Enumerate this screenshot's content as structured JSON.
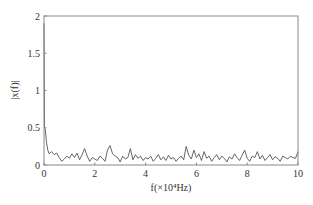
{
  "chart_data": {
    "type": "line",
    "title": "",
    "xlabel": "f(×10⁴Hz)",
    "ylabel": "|x(f)|",
    "xlim": [
      0,
      10
    ],
    "ylim": [
      0,
      2
    ],
    "xticks": [
      0,
      2,
      4,
      6,
      8,
      10
    ],
    "yticks": [
      0,
      0.5,
      1,
      1.5,
      2
    ],
    "xtick_labels": [
      "0",
      "2",
      "4",
      "6",
      "8",
      "10"
    ],
    "ytick_labels": [
      "0",
      "0.5",
      "1",
      "1.5",
      "2"
    ],
    "grid": false,
    "legend": null,
    "series": [
      {
        "name": "spectrum",
        "color": "#555555",
        "x": [
          0,
          0.02,
          0.05,
          0.1,
          0.15,
          0.2,
          0.3,
          0.4,
          0.5,
          0.6,
          0.7,
          0.8,
          0.9,
          1.0,
          1.1,
          1.2,
          1.3,
          1.4,
          1.5,
          1.6,
          1.7,
          1.8,
          1.9,
          2.0,
          2.1,
          2.2,
          2.3,
          2.4,
          2.5,
          2.6,
          2.7,
          2.8,
          2.9,
          3.0,
          3.1,
          3.2,
          3.3,
          3.4,
          3.5,
          3.6,
          3.7,
          3.8,
          3.9,
          4.0,
          4.1,
          4.2,
          4.3,
          4.4,
          4.5,
          4.6,
          4.7,
          4.8,
          4.9,
          5.0,
          5.1,
          5.2,
          5.3,
          5.4,
          5.5,
          5.6,
          5.7,
          5.8,
          5.9,
          6.0,
          6.1,
          6.2,
          6.3,
          6.4,
          6.5,
          6.6,
          6.7,
          6.8,
          6.9,
          7.0,
          7.1,
          7.2,
          7.3,
          7.4,
          7.5,
          7.6,
          7.7,
          7.8,
          7.9,
          8.0,
          8.1,
          8.2,
          8.3,
          8.4,
          8.5,
          8.6,
          8.7,
          8.8,
          8.9,
          9.0,
          9.1,
          9.2,
          9.3,
          9.4,
          9.5,
          9.6,
          9.7,
          9.8,
          9.9,
          10.0
        ],
        "y": [
          1.9,
          0.5,
          0.48,
          0.3,
          0.2,
          0.15,
          0.18,
          0.14,
          0.16,
          0.1,
          0.05,
          0.08,
          0.12,
          0.09,
          0.15,
          0.1,
          0.16,
          0.07,
          0.14,
          0.22,
          0.12,
          0.05,
          0.1,
          0.08,
          0.06,
          0.12,
          0.09,
          0.05,
          0.2,
          0.26,
          0.15,
          0.12,
          0.1,
          0.04,
          0.12,
          0.08,
          0.1,
          0.22,
          0.07,
          0.14,
          0.09,
          0.12,
          0.06,
          0.1,
          0.08,
          0.12,
          0.05,
          0.09,
          0.14,
          0.07,
          0.11,
          0.06,
          0.13,
          0.08,
          0.1,
          0.05,
          0.09,
          0.12,
          0.07,
          0.25,
          0.13,
          0.08,
          0.2,
          0.1,
          0.15,
          0.06,
          0.18,
          0.09,
          0.12,
          0.05,
          0.1,
          0.14,
          0.07,
          0.12,
          0.09,
          0.04,
          0.11,
          0.08,
          0.15,
          0.1,
          0.06,
          0.13,
          0.2,
          0.09,
          0.05,
          0.12,
          0.1,
          0.18,
          0.08,
          0.13,
          0.06,
          0.1,
          0.14,
          0.07,
          0.11,
          0.09,
          0.05,
          0.12,
          0.1,
          0.08,
          0.12,
          0.1,
          0.09,
          0.18
        ]
      }
    ]
  }
}
